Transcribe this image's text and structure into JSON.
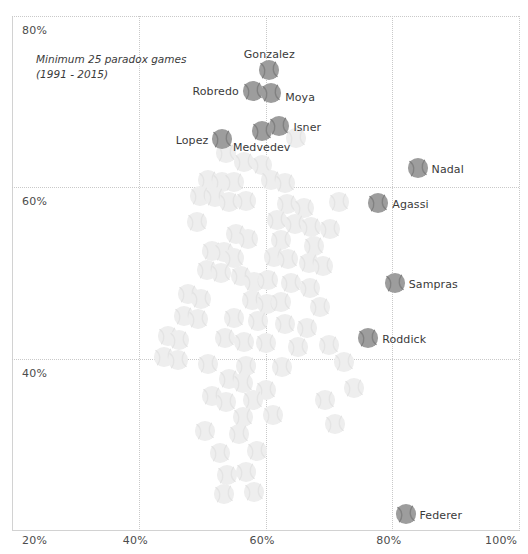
{
  "chart_data": {
    "type": "scatter",
    "title": "",
    "subtitle": "",
    "annotation": [
      "Minimum 25 paradox games",
      "(1991 - 2015)"
    ],
    "xlabel": "",
    "ylabel": "",
    "xlim": [
      20,
      100
    ],
    "ylim": [
      20,
      80
    ],
    "grid": true,
    "legend": "none",
    "marker": "tennis-ball",
    "xticks": [
      {
        "value": 20,
        "label": "20%"
      },
      {
        "value": 40,
        "label": "40%"
      },
      {
        "value": 60,
        "label": "60%"
      },
      {
        "value": 80,
        "label": "80%"
      },
      {
        "value": 100,
        "label": "100%"
      }
    ],
    "yticks": [
      {
        "value": 40,
        "label": "40%"
      },
      {
        "value": 60,
        "label": "60%"
      },
      {
        "value": 80,
        "label": "80%"
      }
    ],
    "labeled_points": [
      {
        "name": "Gonzalez",
        "x": 60.6,
        "y": 73.7,
        "label_pos": "above",
        "label_dx": 0,
        "label_dy": -16
      },
      {
        "name": "Robredo",
        "x": 58.0,
        "y": 71.3,
        "label_pos": "left",
        "label_dx": -14,
        "label_dy": 0
      },
      {
        "name": "Moya",
        "x": 60.9,
        "y": 71.0,
        "label_pos": "right",
        "label_dx": 14,
        "label_dy": 4
      },
      {
        "name": "Isner",
        "x": 62.2,
        "y": 67.2,
        "label_pos": "right",
        "label_dx": 14,
        "label_dy": 1
      },
      {
        "name": "Medvedev",
        "x": 59.4,
        "y": 66.6,
        "label_pos": "below",
        "label_dx": 0,
        "label_dy": 16
      },
      {
        "name": "Lopez",
        "x": 53.2,
        "y": 65.6,
        "label_pos": "left",
        "label_dx": -14,
        "label_dy": 1
      },
      {
        "name": "Nadal",
        "x": 84.0,
        "y": 62.2,
        "label_pos": "right",
        "label_dx": 14,
        "label_dy": 1
      },
      {
        "name": "Agassi",
        "x": 77.8,
        "y": 58.2,
        "label_pos": "right",
        "label_dx": 14,
        "label_dy": 1
      },
      {
        "name": "Sampras",
        "x": 80.4,
        "y": 48.8,
        "label_pos": "right",
        "label_dx": 14,
        "label_dy": 1
      },
      {
        "name": "Roddick",
        "x": 76.2,
        "y": 42.4,
        "label_pos": "right",
        "label_dx": 14,
        "label_dy": 1
      },
      {
        "name": "Federer",
        "x": 82.1,
        "y": 21.9,
        "label_pos": "right",
        "label_dx": 14,
        "label_dy": 1
      }
    ],
    "unlabeled_points": [
      {
        "x": 53.8,
        "y": 64.0
      },
      {
        "x": 59.4,
        "y": 62.6
      },
      {
        "x": 51.0,
        "y": 60.8
      },
      {
        "x": 53.2,
        "y": 60.6
      },
      {
        "x": 55.1,
        "y": 60.6
      },
      {
        "x": 60.8,
        "y": 60.9
      },
      {
        "x": 63.0,
        "y": 60.5
      },
      {
        "x": 49.6,
        "y": 59.0
      },
      {
        "x": 52.0,
        "y": 58.9
      },
      {
        "x": 54.2,
        "y": 58.3
      },
      {
        "x": 57.0,
        "y": 58.4
      },
      {
        "x": 63.4,
        "y": 58.0
      },
      {
        "x": 66.0,
        "y": 57.6
      },
      {
        "x": 71.6,
        "y": 58.3
      },
      {
        "x": 49.2,
        "y": 56.0
      },
      {
        "x": 61.8,
        "y": 56.2
      },
      {
        "x": 64.6,
        "y": 55.7
      },
      {
        "x": 67.2,
        "y": 55.4
      },
      {
        "x": 70.2,
        "y": 55.1
      },
      {
        "x": 55.4,
        "y": 54.6
      },
      {
        "x": 57.2,
        "y": 54.0
      },
      {
        "x": 62.4,
        "y": 53.8
      },
      {
        "x": 67.6,
        "y": 53.2
      },
      {
        "x": 51.6,
        "y": 52.6
      },
      {
        "x": 53.4,
        "y": 52.4
      },
      {
        "x": 55.0,
        "y": 51.8
      },
      {
        "x": 61.4,
        "y": 51.9
      },
      {
        "x": 63.6,
        "y": 51.6
      },
      {
        "x": 66.8,
        "y": 51.2
      },
      {
        "x": 69.0,
        "y": 50.8
      },
      {
        "x": 50.8,
        "y": 50.4
      },
      {
        "x": 53.0,
        "y": 50.0
      },
      {
        "x": 56.2,
        "y": 49.6
      },
      {
        "x": 58.2,
        "y": 49.0
      },
      {
        "x": 60.4,
        "y": 49.2
      },
      {
        "x": 64.0,
        "y": 48.8
      },
      {
        "x": 67.0,
        "y": 48.2
      },
      {
        "x": 47.8,
        "y": 47.6
      },
      {
        "x": 49.8,
        "y": 47.0
      },
      {
        "x": 57.8,
        "y": 46.8
      },
      {
        "x": 60.2,
        "y": 46.4
      },
      {
        "x": 62.4,
        "y": 46.6
      },
      {
        "x": 68.6,
        "y": 46.0
      },
      {
        "x": 47.2,
        "y": 45.0
      },
      {
        "x": 49.4,
        "y": 44.6
      },
      {
        "x": 55.0,
        "y": 44.8
      },
      {
        "x": 58.8,
        "y": 44.4
      },
      {
        "x": 63.0,
        "y": 44.0
      },
      {
        "x": 66.6,
        "y": 43.6
      },
      {
        "x": 44.6,
        "y": 42.6
      },
      {
        "x": 46.4,
        "y": 42.2
      },
      {
        "x": 53.6,
        "y": 42.4
      },
      {
        "x": 56.6,
        "y": 42.0
      },
      {
        "x": 60.0,
        "y": 41.8
      },
      {
        "x": 65.2,
        "y": 41.4
      },
      {
        "x": 70.0,
        "y": 41.6
      },
      {
        "x": 44.0,
        "y": 40.2
      },
      {
        "x": 46.2,
        "y": 39.8
      },
      {
        "x": 51.0,
        "y": 39.4
      },
      {
        "x": 57.0,
        "y": 39.2
      },
      {
        "x": 62.6,
        "y": 39.0
      },
      {
        "x": 54.2,
        "y": 37.6
      },
      {
        "x": 56.4,
        "y": 37.2
      },
      {
        "x": 60.0,
        "y": 36.4
      },
      {
        "x": 51.6,
        "y": 35.6
      },
      {
        "x": 53.8,
        "y": 35.0
      },
      {
        "x": 58.0,
        "y": 35.2
      },
      {
        "x": 56.4,
        "y": 33.2
      },
      {
        "x": 61.2,
        "y": 33.4
      },
      {
        "x": 50.4,
        "y": 31.6
      },
      {
        "x": 55.8,
        "y": 31.2
      },
      {
        "x": 52.8,
        "y": 29.0
      },
      {
        "x": 58.6,
        "y": 29.2
      },
      {
        "x": 54.0,
        "y": 26.4
      },
      {
        "x": 57.0,
        "y": 26.8
      },
      {
        "x": 53.4,
        "y": 24.2
      },
      {
        "x": 58.2,
        "y": 24.4
      },
      {
        "x": 72.4,
        "y": 39.6
      },
      {
        "x": 74.0,
        "y": 36.6
      },
      {
        "x": 69.4,
        "y": 35.2
      },
      {
        "x": 71.0,
        "y": 32.4
      },
      {
        "x": 64.8,
        "y": 65.8
      },
      {
        "x": 56.6,
        "y": 63.0
      }
    ]
  },
  "colors": {
    "marker_labeled": "#9d9d9d",
    "marker_faint": "#eeeeee",
    "grid": "#c9c9c9",
    "axis": "#d2d2d2",
    "text": "#3a3a3a",
    "tick_text": "#4c4c4c",
    "background": "#ffffff"
  }
}
